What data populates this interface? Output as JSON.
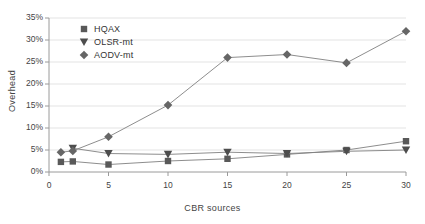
{
  "chart_data": {
    "type": "line",
    "title": "",
    "xlabel": "CBR sources",
    "ylabel": "Overhead",
    "xlim": [
      0,
      30
    ],
    "ylim": [
      0,
      35
    ],
    "grid": true,
    "legend_position": "top-left",
    "x_tick_labels": [
      "0",
      "5",
      "10",
      "15",
      "20",
      "25",
      "30"
    ],
    "x_ticks": [
      0,
      5,
      10,
      15,
      20,
      25,
      30
    ],
    "y_tick_labels": [
      "0%",
      "5%",
      "10%",
      "15%",
      "20%",
      "25%",
      "30%",
      "35%"
    ],
    "y_ticks": [
      0,
      5,
      10,
      15,
      20,
      25,
      30,
      35
    ],
    "series": [
      {
        "name": "HQAX",
        "marker": "square",
        "color": "#595959",
        "x": [
          1,
          2,
          5,
          10,
          15,
          20,
          25,
          30
        ],
        "values": [
          2.3,
          2.4,
          1.7,
          2.5,
          3.0,
          4.0,
          5.0,
          7.0
        ]
      },
      {
        "name": "OLSR-mt",
        "marker": "triangle-down",
        "color": "#4d4d4d",
        "x": [
          2,
          5,
          10,
          15,
          20,
          25,
          30
        ],
        "values": [
          5.4,
          4.2,
          4.0,
          4.5,
          4.2,
          4.7,
          5.0
        ]
      },
      {
        "name": "AODV-mt",
        "marker": "diamond",
        "color": "#666666",
        "x": [
          1,
          2,
          5,
          10,
          15,
          20,
          25,
          30
        ],
        "values": [
          4.5,
          4.8,
          8.0,
          15.2,
          26.0,
          26.7,
          24.8,
          32.0
        ]
      }
    ]
  },
  "legend": {
    "items": [
      {
        "label": "HQAX"
      },
      {
        "label": "OLSR-mt"
      },
      {
        "label": "AODV-mt"
      }
    ]
  },
  "axes": {
    "y_title": "Overhead",
    "x_title": "CBR sources"
  },
  "colors": {
    "plot_line": "#808080",
    "grid": "#e3e3e3",
    "axis": "#9a9a9a",
    "text": "#3a3a3a"
  }
}
